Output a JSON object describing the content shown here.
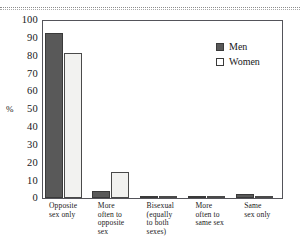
{
  "chart_data": {
    "type": "bar",
    "title": "",
    "xlabel": "",
    "ylabel": "%",
    "ylim": [
      0,
      100
    ],
    "yticks": [
      100,
      90,
      80,
      70,
      60,
      50,
      40,
      30,
      20,
      10,
      0
    ],
    "grid": false,
    "legend_position": "top-right",
    "categories": [
      "Opposite sex only",
      "More often to opposite sex",
      "Bisexual (equally to both sexes)",
      "More often to same sex",
      "Same sex only"
    ],
    "category_lines": [
      [
        "Opposite",
        "sex only"
      ],
      [
        "More",
        "often to",
        "opposite",
        "sex"
      ],
      [
        "Bisexual",
        "(equally",
        "to both",
        "sexes)"
      ],
      [
        "More",
        "often to",
        "same sex"
      ],
      [
        "Same",
        "sex only"
      ]
    ],
    "series": [
      {
        "name": "Men",
        "color": "#595959",
        "values": [
          93,
          4,
          1,
          0.5,
          2
        ]
      },
      {
        "name": "Women",
        "color": "#f2f2f0",
        "values": [
          82,
          14.5,
          1,
          1,
          1
        ]
      }
    ]
  },
  "legend": {
    "items": [
      {
        "label": "Men"
      },
      {
        "label": "Women"
      }
    ]
  },
  "axis": {
    "unit_label": "%"
  },
  "colors": {
    "men_fill": "#595959",
    "women_fill": "#f2f2f0",
    "bar_outline": "#3a3a3a",
    "frame": "#54545a",
    "background": "#ffffff"
  }
}
